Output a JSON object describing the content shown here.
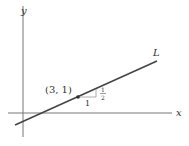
{
  "diagram": {
    "axis_x_label": "x",
    "axis_y_label": "y",
    "line_label": "L",
    "point_label": "(3, 1)",
    "run_label": "1",
    "rise_numerator": "1",
    "rise_denominator": "2",
    "colors": {
      "line": "#444444",
      "axis": "#666666",
      "triangle": "#888888"
    }
  }
}
